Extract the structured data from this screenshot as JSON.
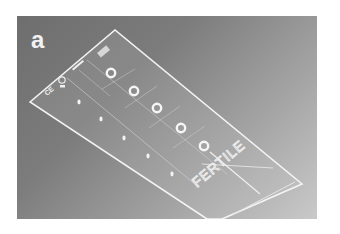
{
  "figure": {
    "panel_label": "a",
    "slide_text": "FERTILE",
    "chamber_count": 5
  }
}
